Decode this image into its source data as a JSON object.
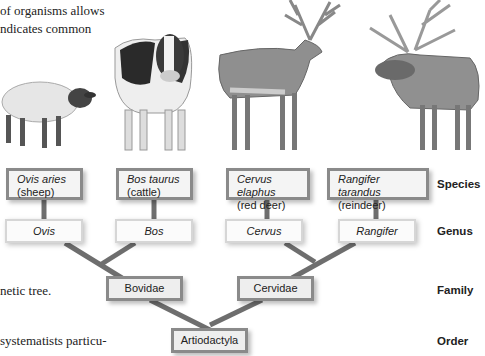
{
  "text_fragments": {
    "line1": "of organisms allows",
    "line2": "ndicates common",
    "line3": "netic tree.",
    "line4": "systematists particu-"
  },
  "ranks": {
    "species": "Species",
    "genus": "Genus",
    "family": "Family",
    "order": "Order"
  },
  "species": [
    {
      "scientific": "Ovis aries",
      "common": "(sheep)"
    },
    {
      "scientific": "Bos taurus",
      "common": "(cattle)"
    },
    {
      "scientific": "Cervus elaphus",
      "common": "(red deer)"
    },
    {
      "scientific": "Rangifer tarandus",
      "common": "(reindeer)"
    }
  ],
  "genus": [
    "Ovis",
    "Bos",
    "Cervus",
    "Rangifer"
  ],
  "family": [
    "Bovidae",
    "Cervidae"
  ],
  "order": "Artiodactyla",
  "animals": [
    "sheep",
    "cattle",
    "red deer",
    "reindeer"
  ],
  "colors": {
    "branch": "#6e6e6e",
    "box_border": "#8a8a8a",
    "box_fill": "#f4f4f4"
  }
}
